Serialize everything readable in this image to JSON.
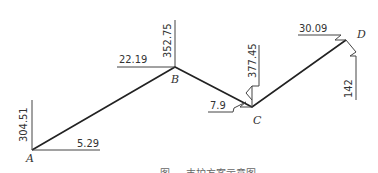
{
  "diagram": {
    "points": [
      {
        "label": "A"
      },
      {
        "label": "B"
      },
      {
        "label": "C"
      },
      {
        "label": "D"
      }
    ],
    "dimensions": {
      "A_vertical": "304.51",
      "A_horizontal": "5.29",
      "B_vertical": "352.75",
      "B_horizontal": "22.19",
      "C_vertical": "377.45",
      "C_horizontal": "7.9",
      "D_horizontal": "30.09",
      "D_vertical": "142"
    },
    "caption": "图 … 支护方案示意图"
  }
}
